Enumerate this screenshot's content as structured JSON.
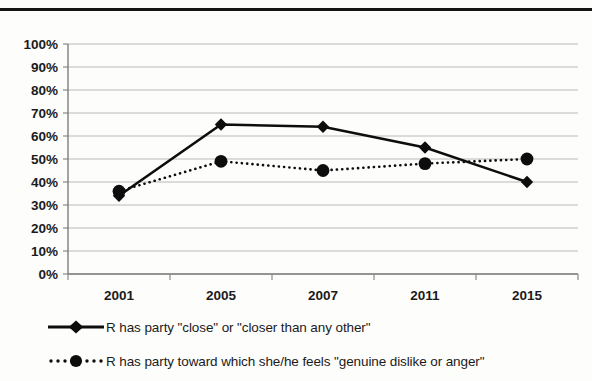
{
  "figure": {
    "top_rule": "horizontal-rule",
    "background_color": "#fdfdfc",
    "ink_color": "#0d0d0d",
    "gridline_color": "#b9b9b9"
  },
  "chart_data": {
    "type": "line",
    "title": "",
    "subtitle": "",
    "xlabel": "",
    "ylabel": "",
    "categories": [
      "2001",
      "2005",
      "2007",
      "2011",
      "2015"
    ],
    "ylim": [
      0,
      100
    ],
    "ytick_labels": [
      "0%",
      "10%",
      "20%",
      "30%",
      "40%",
      "50%",
      "60%",
      "70%",
      "80%",
      "90%",
      "100%"
    ],
    "ytick_values": [
      0,
      10,
      20,
      30,
      40,
      50,
      60,
      70,
      80,
      90,
      100
    ],
    "ytick_suffix": "%",
    "grid": true,
    "grid_axis": "y",
    "legend_position": "bottom-left",
    "series": [
      {
        "name": "R has party \"close\" or \"closer than any other\"",
        "values": [
          34,
          65,
          64,
          55,
          40
        ],
        "line_style": "solid",
        "marker": "diamond",
        "color": "#0d0d0d"
      },
      {
        "name": "R has party toward which she/he feels \"genuine dislike or anger\"",
        "values": [
          36,
          49,
          45,
          48,
          50
        ],
        "line_style": "dotted",
        "marker": "circle",
        "color": "#0d0d0d"
      }
    ]
  },
  "legend": {
    "entries": [
      {
        "label": "R has party \"close\" or \"closer than any other\"",
        "marker": "diamond",
        "line_style": "solid"
      },
      {
        "label": "R has party toward which she/he feels \"genuine dislike or anger\"",
        "marker": "circle",
        "line_style": "dotted"
      }
    ]
  }
}
